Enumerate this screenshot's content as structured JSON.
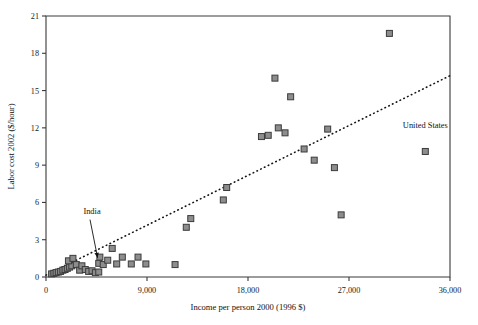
{
  "chart_data": {
    "type": "scatter",
    "title": "",
    "xlabel": "Income per person 2000 (1996 $)",
    "ylabel": "Labor cost 2002 ($/hour)",
    "xlim": [
      0,
      36000
    ],
    "ylim": [
      0,
      21
    ],
    "xticks": [
      0,
      9000,
      18000,
      27000,
      36000
    ],
    "xticklabels": [
      "0",
      "9,000",
      "18,000",
      "27,000",
      "36,000"
    ],
    "yticks": [
      0,
      3,
      6,
      9,
      12,
      15,
      18,
      21
    ],
    "yticklabels": [
      "0",
      "3",
      "6",
      "9",
      "12",
      "15",
      "18",
      "21"
    ],
    "grid": false,
    "legend": false,
    "marker": "square",
    "marker_color": "#8d8d8d",
    "marker_edge_color": "#3b3b3b",
    "series": [
      {
        "name": "Countries",
        "points": [
          [
            500,
            0.25
          ],
          [
            700,
            0.3
          ],
          [
            900,
            0.35
          ],
          [
            1100,
            0.4
          ],
          [
            1300,
            0.45
          ],
          [
            1500,
            0.55
          ],
          [
            1700,
            0.6
          ],
          [
            1900,
            0.7
          ],
          [
            2100,
            0.8
          ],
          [
            2300,
            0.9
          ],
          [
            2000,
            1.3
          ],
          [
            2400,
            1.5
          ],
          [
            2700,
            1.0
          ],
          [
            3000,
            0.55
          ],
          [
            3200,
            0.9
          ],
          [
            3500,
            0.6
          ],
          [
            3800,
            0.45
          ],
          [
            4100,
            0.5
          ],
          [
            4400,
            0.35
          ],
          [
            4700,
            0.4
          ],
          [
            4700,
            1.1
          ],
          [
            4800,
            1.6
          ],
          [
            5100,
            1.0
          ],
          [
            5500,
            1.35
          ],
          [
            5900,
            2.3
          ],
          [
            6300,
            1.05
          ],
          [
            6800,
            1.6
          ],
          [
            7600,
            1.05
          ],
          [
            8200,
            1.6
          ],
          [
            8900,
            1.05
          ],
          [
            11500,
            1.0
          ],
          [
            12500,
            4.0
          ],
          [
            12900,
            4.7
          ],
          [
            15800,
            6.2
          ],
          [
            16100,
            7.2
          ],
          [
            19200,
            11.3
          ],
          [
            19800,
            11.4
          ],
          [
            20400,
            16.0
          ],
          [
            20700,
            12.0
          ],
          [
            21300,
            11.6
          ],
          [
            21800,
            14.5
          ],
          [
            23000,
            10.3
          ],
          [
            23900,
            9.4
          ],
          [
            25100,
            11.9
          ],
          [
            25700,
            8.8
          ],
          [
            26300,
            5.0
          ],
          [
            30600,
            19.6
          ],
          [
            33800,
            10.1
          ]
        ]
      }
    ],
    "trend_line": {
      "style": "dotted",
      "x0": 0,
      "y0": 0.15,
      "x1": 36000,
      "y1": 16.2
    },
    "annotations": [
      {
        "text": "India",
        "label_x": 4100,
        "label_y": 5.1,
        "point_x": 4600,
        "point_y": 1.55,
        "arrow": true
      },
      {
        "text": "United States",
        "label_x": 33800,
        "label_y": 12.0,
        "point_x": 33800,
        "point_y": 10.1,
        "arrow": false
      }
    ]
  }
}
